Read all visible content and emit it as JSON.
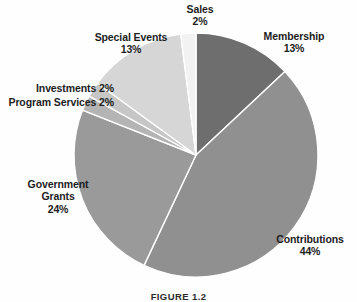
{
  "figure": {
    "caption": "FIGURE 1.2",
    "background_color": "#fefefe",
    "label_color": "#1d1d1d"
  },
  "labels": {
    "sales": {
      "name": "Sales",
      "pct": "2%"
    },
    "membership": {
      "name": "Membership",
      "pct": "13%"
    },
    "special_events": {
      "name": "Special Events",
      "pct": "13%"
    },
    "investments": {
      "name": "Investments",
      "pct": "2%"
    },
    "program_services": {
      "name": "Program Services",
      "pct": "2%"
    },
    "government_grants": {
      "name": "Government",
      "name2": "Grants",
      "pct": "24%"
    },
    "contributions": {
      "name": "Contributions",
      "pct": "44%"
    }
  },
  "chart_data": {
    "type": "pie",
    "title": "",
    "legend": "labels-outside",
    "start_angle_deg": 0,
    "direction": "clockwise",
    "center": [
      196,
      155
    ],
    "radius": 122,
    "categories": [
      "Membership",
      "Contributions",
      "Government Grants",
      "Program Services",
      "Investments",
      "Special Events",
      "Sales"
    ],
    "values": [
      13,
      44,
      24,
      2,
      2,
      13,
      2
    ],
    "unit": "percent",
    "colors": [
      "#6e6e6e",
      "#909090",
      "#9a9a9a",
      "#b4b4b4",
      "#c6c6c6",
      "#d6d6d6",
      "#f2f2f2"
    ],
    "slice_border_color": "#ffffff"
  }
}
